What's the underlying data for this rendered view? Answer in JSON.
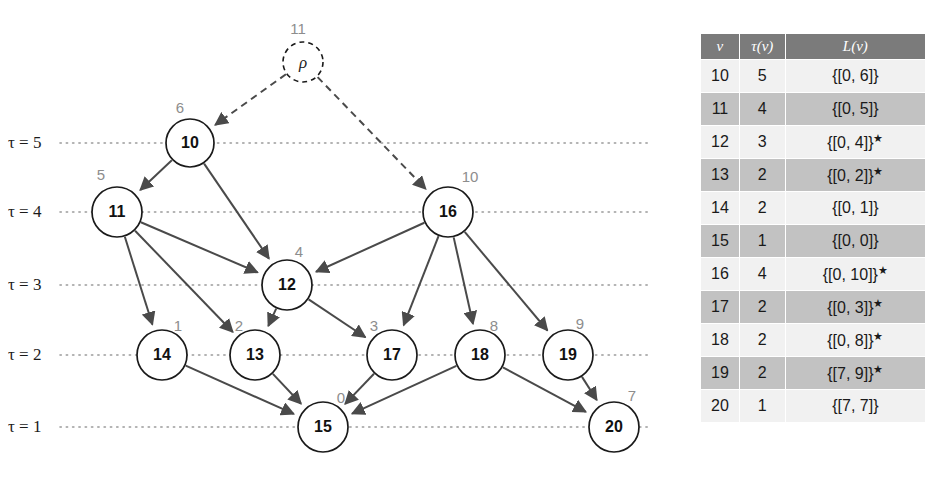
{
  "figure": {
    "kind": "layered-dag-with-label-table"
  },
  "graph": {
    "tau_levels": [
      {
        "id": "tau-5",
        "label": "τ = 5",
        "y": 143
      },
      {
        "id": "tau-4",
        "label": "τ = 4",
        "y": 212
      },
      {
        "id": "tau-3",
        "label": "τ = 3",
        "y": 285
      },
      {
        "id": "tau-2",
        "label": "τ = 2",
        "y": 355
      },
      {
        "id": "tau-1",
        "label": "τ = 1",
        "y": 427
      }
    ],
    "root": {
      "name": "rho",
      "glyph": "ρ",
      "tag": "11",
      "cx": 303,
      "cy": 62,
      "r": 20,
      "dashed": true
    },
    "nodes": [
      {
        "id": "10",
        "tag": "6",
        "cx": 190,
        "cy": 143,
        "r": 24
      },
      {
        "id": "11",
        "tag": "5",
        "cx": 117,
        "cy": 212,
        "r": 25
      },
      {
        "id": "16",
        "tag": "10",
        "cx": 448,
        "cy": 212,
        "r": 25
      },
      {
        "id": "12",
        "tag": "4",
        "cx": 287,
        "cy": 285,
        "r": 25
      },
      {
        "id": "14",
        "tag": "1",
        "cx": 162,
        "cy": 355,
        "r": 25
      },
      {
        "id": "13",
        "tag": "2",
        "cx": 255,
        "cy": 355,
        "r": 25
      },
      {
        "id": "17",
        "tag": "3",
        "cx": 392,
        "cy": 355,
        "r": 25
      },
      {
        "id": "18",
        "tag": "8",
        "cx": 480,
        "cy": 355,
        "r": 25
      },
      {
        "id": "19",
        "tag": "9",
        "cx": 568,
        "cy": 355,
        "r": 25
      },
      {
        "id": "15",
        "tag": "0",
        "cx": 323,
        "cy": 427,
        "r": 25
      },
      {
        "id": "20",
        "tag": "7",
        "cx": 614,
        "cy": 427,
        "r": 25
      }
    ],
    "edges": [
      {
        "from": "rho",
        "to": "10",
        "dashed": true
      },
      {
        "from": "rho",
        "to": "16",
        "dashed": true
      },
      {
        "from": "10",
        "to": "11",
        "dashed": false
      },
      {
        "from": "10",
        "to": "12",
        "dashed": false
      },
      {
        "from": "11",
        "to": "12",
        "dashed": false
      },
      {
        "from": "11",
        "to": "13",
        "dashed": false
      },
      {
        "from": "11",
        "to": "14",
        "dashed": false
      },
      {
        "from": "16",
        "to": "12",
        "dashed": false
      },
      {
        "from": "16",
        "to": "17",
        "dashed": false
      },
      {
        "from": "16",
        "to": "18",
        "dashed": false
      },
      {
        "from": "16",
        "to": "19",
        "dashed": false
      },
      {
        "from": "12",
        "to": "13",
        "dashed": false
      },
      {
        "from": "12",
        "to": "17",
        "dashed": false
      },
      {
        "from": "14",
        "to": "15",
        "dashed": false
      },
      {
        "from": "13",
        "to": "15",
        "dashed": false
      },
      {
        "from": "17",
        "to": "15",
        "dashed": false
      },
      {
        "from": "18",
        "to": "15",
        "dashed": false
      },
      {
        "from": "18",
        "to": "20",
        "dashed": false
      },
      {
        "from": "19",
        "to": "20",
        "dashed": false
      }
    ],
    "dotted_line": {
      "x_start": 60,
      "x_end": 650
    }
  },
  "table": {
    "headers": {
      "v": "v",
      "tau": "τ(v)",
      "l": "L(v)"
    },
    "rows": [
      {
        "v": "10",
        "tau": "5",
        "l": "{[0, 6]}",
        "star": false
      },
      {
        "v": "11",
        "tau": "4",
        "l": "{[0, 5]}",
        "star": false
      },
      {
        "v": "12",
        "tau": "3",
        "l": "{[0, 4]}",
        "star": true
      },
      {
        "v": "13",
        "tau": "2",
        "l": "{[0, 2]}",
        "star": true
      },
      {
        "v": "14",
        "tau": "2",
        "l": "{[0, 1]}",
        "star": false
      },
      {
        "v": "15",
        "tau": "1",
        "l": "{[0, 0]}",
        "star": false
      },
      {
        "v": "16",
        "tau": "4",
        "l": "{[0, 10]}",
        "star": true
      },
      {
        "v": "17",
        "tau": "2",
        "l": "{[0, 3]}",
        "star": true
      },
      {
        "v": "18",
        "tau": "2",
        "l": "{[0, 8]}",
        "star": true
      },
      {
        "v": "19",
        "tau": "2",
        "l": "{[7, 9]}",
        "star": true
      },
      {
        "v": "20",
        "tau": "1",
        "l": "{[7, 7]}",
        "star": false
      }
    ]
  },
  "colors": {
    "header_bg": "#7b7b7b",
    "row_light": "#f1f1f1",
    "row_dark": "#c2c2c2",
    "node_stroke": "#1a1a1a",
    "tag_gray": "#8d8d8d",
    "edge": "#4a4a4a"
  }
}
